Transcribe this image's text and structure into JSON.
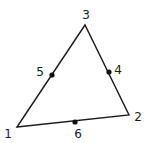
{
  "diagram": {
    "type": "triangle-element",
    "vertices": [
      {
        "id": "1",
        "label": "1",
        "x": 17,
        "y": 127,
        "lx": 8,
        "ly": 138
      },
      {
        "id": "2",
        "label": "2",
        "x": 129,
        "y": 115,
        "lx": 137,
        "ly": 121
      },
      {
        "id": "3",
        "label": "3",
        "x": 85,
        "y": 25,
        "lx": 85,
        "ly": 19
      }
    ],
    "midside_nodes": [
      {
        "id": "4",
        "label": "4",
        "x": 109,
        "y": 72,
        "lx": 117,
        "ly": 74
      },
      {
        "id": "5",
        "label": "5",
        "x": 52,
        "y": 75,
        "lx": 40,
        "ly": 76
      },
      {
        "id": "6",
        "label": "6",
        "x": 75,
        "y": 122,
        "lx": 78,
        "ly": 138
      }
    ],
    "colors": {
      "line": "#1a1a1a",
      "node": "#111111",
      "background": "#ffffff"
    }
  }
}
